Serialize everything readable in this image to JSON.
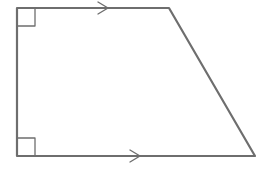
{
  "figure": {
    "type": "right trapezoid",
    "stroke_color": "#6e6e6e",
    "stroke_width": 2.2,
    "vertices": {
      "top_left": [
        17,
        8
      ],
      "top_right": [
        169,
        8
      ],
      "bottom_right": [
        255,
        156
      ],
      "bottom_left": [
        17,
        156
      ]
    },
    "right_angle_markers": [
      {
        "corner": "top_left",
        "size": 18
      },
      {
        "corner": "bottom_left",
        "size": 18
      }
    ],
    "parallel_markers": [
      {
        "edge": "top",
        "tip": [
          108,
          8
        ],
        "direction": "right"
      },
      {
        "edge": "bottom",
        "tip": [
          140,
          156
        ],
        "direction": "right"
      }
    ]
  }
}
